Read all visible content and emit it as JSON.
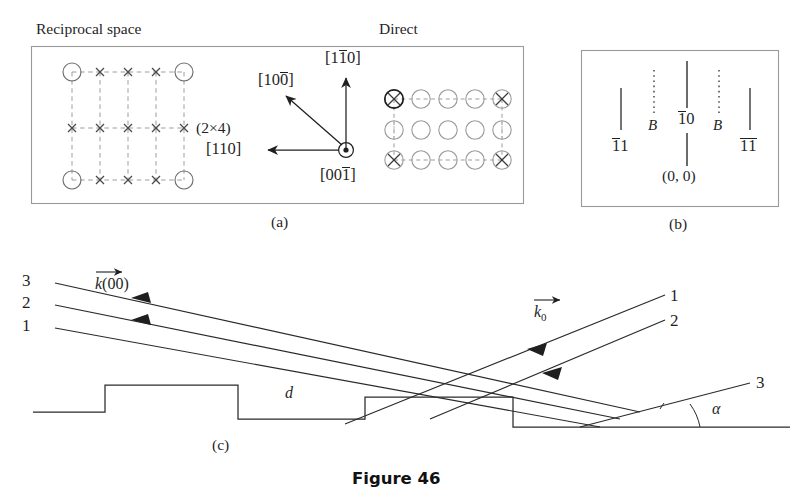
{
  "figure": {
    "caption": "Figure 46",
    "panel_tags": {
      "a": "(a)",
      "b": "(b)",
      "c": "(c)"
    }
  },
  "panel_a": {
    "headers": {
      "reciprocal": "Reciprocal space",
      "direct": "Direct"
    },
    "superstructure_label": "(2×4)",
    "reciprocal_lattice": {
      "columns": 5,
      "rows": 3,
      "corner_marker": "circle-with-cross",
      "inner_marker": "cross",
      "grid_style": "dashed"
    },
    "direct_lattice": {
      "columns": 5,
      "rows": 3,
      "corner_marker": "circle-with-cross",
      "inner_marker": "circle",
      "grid_style": "dashed"
    },
    "axes": [
      {
        "name": "axis-1-10",
        "label_parts": [
          "[1",
          "1",
          "0]"
        ],
        "bar_on": 1,
        "direction": "up"
      },
      {
        "name": "axis-100bar",
        "label_parts": [
          "[10",
          "0",
          "]"
        ],
        "bar_on": 1,
        "direction": "up-left"
      },
      {
        "name": "axis-110",
        "label_parts": [
          "[110]"
        ],
        "bar_on": -1,
        "direction": "left"
      },
      {
        "name": "axis-001bar",
        "label_parts": [
          "[00",
          "1",
          "]"
        ],
        "bar_on": 1,
        "direction": "out-of-plane"
      }
    ]
  },
  "panel_b": {
    "streaks": [
      {
        "name": "streak-1bar1",
        "label_pre": "1",
        "label_post": "1",
        "bar": "first",
        "style": "solid"
      },
      {
        "name": "streak-B-left",
        "label": "B",
        "style": "dotted"
      },
      {
        "name": "streak-1bar0",
        "label_pre": "1",
        "label_post": "0",
        "bar": "first",
        "style": "solid-split"
      },
      {
        "name": "streak-B-right",
        "label": "B",
        "style": "dotted"
      },
      {
        "name": "streak-1bar1bar",
        "label_pre": "1",
        "label_post": "1",
        "bar": "both",
        "style": "solid"
      }
    ],
    "origin_label": "(0, 0)"
  },
  "panel_c": {
    "outgoing_beam_labels": [
      "3",
      "2",
      "1"
    ],
    "incoming_beam_labels": [
      "1",
      "2",
      "3"
    ],
    "wavevector_out": {
      "symbol": "k",
      "arg": "(00)"
    },
    "wavevector_in": {
      "symbol": "k",
      "sub": "0"
    },
    "step_height_label": "d",
    "angle_label": "α"
  },
  "colors": {
    "ink": "#1f1f1f",
    "line": "#2a2a2a",
    "dashed": "#8a8a8a",
    "box": "#9a9a9a",
    "background": "#ffffff"
  }
}
